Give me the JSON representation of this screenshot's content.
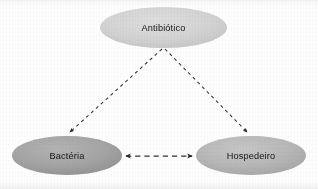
{
  "diagram": {
    "type": "relationship-diagram",
    "background_color": "#fdfdfd",
    "nodes": [
      {
        "id": "antibiotico",
        "label": "Antibiótico",
        "shape": "ellipse",
        "cx": 163.5,
        "cy": 27.5,
        "rx": 63.5,
        "ry": 20.5,
        "fill_color": "#cfcfcf",
        "fill_color_light": "#dcdcdc",
        "text_color": "#151515"
      },
      {
        "id": "bacteria",
        "label": "Bactéria",
        "shape": "ellipse",
        "cx": 67.0,
        "cy": 155.5,
        "rx": 55.0,
        "ry": 19.5,
        "fill_color": "#a2a2a2",
        "fill_color_light": "#b4b4b4",
        "text_color": "#111111"
      },
      {
        "id": "hospedeiro",
        "label": "Hospedeiro",
        "shape": "ellipse",
        "cx": 251.0,
        "cy": 155.5,
        "rx": 55.0,
        "ry": 19.5,
        "fill_color": "#b6b6b6",
        "fill_color_light": "#c6c6c6",
        "text_color": "#111111"
      }
    ],
    "edges": [
      {
        "id": "antibiotico-to-bacteria",
        "from": "antibiotico",
        "to": "bacteria",
        "style": "dashed",
        "direction": "one-way",
        "color": "#303030",
        "x1": 162.0,
        "y1": 49.0,
        "x2": 70.0,
        "y2": 132.0
      },
      {
        "id": "antibiotico-to-hospedeiro",
        "from": "antibiotico",
        "to": "hospedeiro",
        "style": "dashed",
        "direction": "one-way",
        "color": "#303030",
        "x1": 165.0,
        "y1": 49.0,
        "x2": 247.0,
        "y2": 132.0
      },
      {
        "id": "bacteria-hospedeiro",
        "from": "bacteria",
        "to": "hospedeiro",
        "style": "dashed",
        "direction": "two-way",
        "color": "#303030",
        "x1": 125.0,
        "y1": 156.0,
        "x2": 193.0,
        "y2": 156.0
      }
    ]
  }
}
